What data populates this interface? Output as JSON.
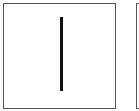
{
  "cards": [
    {
      "symbol": "vertical-line",
      "border_color": "#555555",
      "stroke_color": "#111111"
    },
    {
      "symbol": "partially-visible"
    }
  ]
}
